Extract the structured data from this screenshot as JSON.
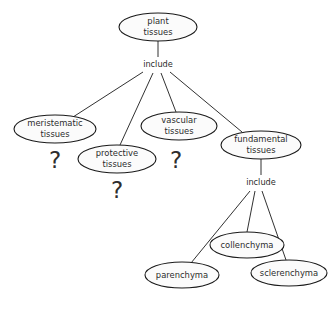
{
  "diagram": {
    "type": "concept-map",
    "background_color": "#ffffff",
    "node_fill_color": "#fbfbfb",
    "node_stroke_color": "#1a1a1a",
    "text_color": "#2b2b2b",
    "nodes": [
      {
        "id": "plant-tissues",
        "label": "plant\ntissues",
        "line1": "plant",
        "line2": "tissues",
        "cx": 158,
        "cy": 27,
        "rx": 39,
        "ry": 14
      },
      {
        "id": "meristematic",
        "label": "meristematic\ntissues",
        "line1": "meristematic",
        "line2": "tissues",
        "cx": 55,
        "cy": 129,
        "rx": 41,
        "ry": 14
      },
      {
        "id": "protective",
        "label": "protective\ntissues",
        "line1": "protective",
        "line2": "tissues",
        "cx": 117,
        "cy": 159,
        "rx": 39,
        "ry": 14
      },
      {
        "id": "vascular",
        "label": "vascular\ntissues",
        "line1": "vascular",
        "line2": "tissues",
        "cx": 179,
        "cy": 126,
        "rx": 38,
        "ry": 14
      },
      {
        "id": "fundamental",
        "label": "fundamental\ntissues",
        "line1": "fundamental",
        "line2": "tissues",
        "cx": 261,
        "cy": 145,
        "rx": 40,
        "ry": 14
      },
      {
        "id": "parenchyma",
        "label": "parenchyma",
        "line1": "parenchyma",
        "line2": "",
        "cx": 182,
        "cy": 275,
        "rx": 37,
        "ry": 13
      },
      {
        "id": "collenchyma",
        "label": "collenchyma",
        "line1": "collenchyma",
        "line2": "",
        "cx": 247,
        "cy": 245,
        "rx": 37,
        "ry": 13
      },
      {
        "id": "sclerenchyma",
        "label": "sclerenchyma",
        "line1": "sclerenchyma",
        "line2": "",
        "cx": 289,
        "cy": 273,
        "rx": 38,
        "ry": 13
      }
    ],
    "link_labels": [
      {
        "id": "include-top",
        "text": "include",
        "x": 158,
        "y": 64
      },
      {
        "id": "include-bottom",
        "text": "include",
        "x": 261,
        "y": 182
      }
    ],
    "question_marks": [
      {
        "id": "qmark-meristematic-to-protective",
        "text": "?",
        "x": 55,
        "y": 161
      },
      {
        "id": "qmark-vascular-to-fundamental",
        "text": "?",
        "x": 176,
        "y": 161
      },
      {
        "id": "qmark-protective-below",
        "text": "?",
        "x": 117,
        "y": 191
      }
    ],
    "edges": [
      {
        "id": "plant-to-include",
        "x1": 158,
        "y1": 41,
        "x2": 158,
        "y2": 57
      },
      {
        "id": "include-to-meristematic",
        "x1": 143,
        "y1": 72,
        "x2": 73,
        "y2": 117
      },
      {
        "id": "include-to-protective",
        "x1": 153,
        "y1": 73,
        "x2": 120,
        "y2": 145
      },
      {
        "id": "include-to-vascular",
        "x1": 161,
        "y1": 73,
        "x2": 176,
        "y2": 112
      },
      {
        "id": "include-to-fundamental",
        "x1": 170,
        "y1": 72,
        "x2": 242,
        "y2": 132
      },
      {
        "id": "fundamental-to-include2",
        "x1": 261,
        "y1": 159,
        "x2": 261,
        "y2": 175
      },
      {
        "id": "include2-to-parenchyma",
        "x1": 250,
        "y1": 191,
        "x2": 191,
        "y2": 263
      },
      {
        "id": "include2-to-collenchyma",
        "x1": 255,
        "y1": 191,
        "x2": 247,
        "y2": 232
      },
      {
        "id": "include2-to-sclerenchyma",
        "x1": 262,
        "y1": 191,
        "x2": 286,
        "y2": 260
      }
    ]
  }
}
